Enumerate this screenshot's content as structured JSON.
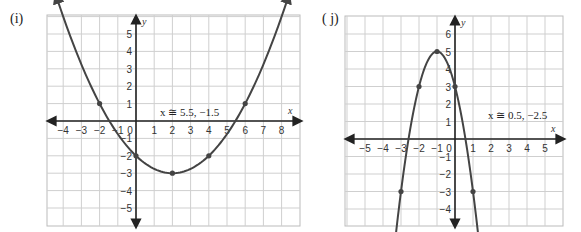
{
  "chart_data": [
    {
      "type": "line",
      "panel_label": "(i)",
      "title": "",
      "xlabel": "x",
      "ylabel": "y",
      "xlim": [
        -5,
        9
      ],
      "ylim": [
        -6,
        6
      ],
      "grid": true,
      "x_ticks": [
        -4,
        -3,
        -2,
        -1,
        0,
        1,
        2,
        3,
        4,
        5,
        6,
        7,
        8
      ],
      "y_ticks": [
        5,
        4,
        3,
        2,
        1,
        -1,
        -2,
        -3,
        -4,
        -5
      ],
      "annotation": "x ≅ 5.5, −1.5",
      "function": "y = 0.25(x-2)^2 - 3",
      "points": [
        {
          "x": -2,
          "y": 1
        },
        {
          "x": 0,
          "y": -2
        },
        {
          "x": 2,
          "y": -3
        },
        {
          "x": 4,
          "y": -2
        },
        {
          "x": 6,
          "y": 1
        }
      ],
      "roots": [
        -1.5,
        5.5
      ]
    },
    {
      "type": "line",
      "panel_label": "( j)",
      "title": "",
      "xlabel": "x",
      "ylabel": "y",
      "xlim": [
        -6,
        6
      ],
      "ylim": [
        -5,
        7
      ],
      "grid": true,
      "x_ticks": [
        -5,
        -4,
        -3,
        -2,
        -1,
        0,
        1,
        2,
        3,
        4,
        5
      ],
      "y_ticks": [
        6,
        5,
        4,
        3,
        2,
        1,
        -1,
        -2,
        -3,
        -4
      ],
      "annotation": "x ≅ 0.5, −2.5",
      "function": "y = -2(x+1)^2 + 5",
      "points": [
        {
          "x": -3,
          "y": -3
        },
        {
          "x": -2,
          "y": 3
        },
        {
          "x": -1,
          "y": 5
        },
        {
          "x": 0,
          "y": 3
        },
        {
          "x": 1,
          "y": -3
        }
      ],
      "roots": [
        -2.5,
        0.5
      ]
    }
  ],
  "panels": {
    "i": {
      "label": "(i)"
    },
    "j": {
      "label": "( j)"
    }
  }
}
